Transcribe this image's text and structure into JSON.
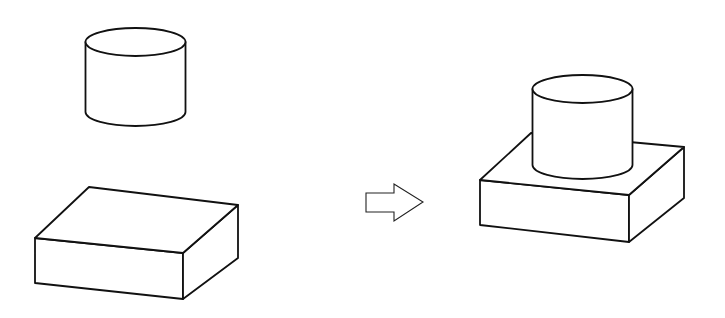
{
  "diagram": {
    "type": "assembly-step",
    "colors": {
      "background": "#ffffff",
      "line": "#111111"
    },
    "before": {
      "parts": [
        {
          "name": "cylinder",
          "position": "above",
          "state": "separate"
        },
        {
          "name": "rectangular-block",
          "position": "below",
          "state": "separate"
        }
      ]
    },
    "transition": {
      "icon": "right-arrow-outline-icon",
      "direction": "right"
    },
    "after": {
      "parts": [
        {
          "name": "cylinder",
          "position": "on-top-of-block",
          "state": "assembled"
        },
        {
          "name": "rectangular-block",
          "position": "base",
          "state": "assembled"
        }
      ]
    }
  }
}
